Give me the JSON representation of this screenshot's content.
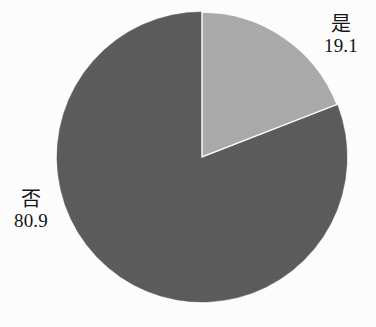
{
  "chart_data": {
    "type": "pie",
    "title": "",
    "categories": [
      "是",
      "否"
    ],
    "values": [
      19.1,
      80.9
    ],
    "labels": [
      "19.1",
      "80.9"
    ],
    "series": [
      {
        "name": "",
        "values": [
          19.1,
          80.9
        ]
      }
    ],
    "slices": [
      {
        "category": "是",
        "value": 19.1,
        "value_label": "19.1",
        "color": "#a9a9a9",
        "start_angle_deg": 0,
        "sweep_angle_deg": 68.8,
        "label_position": "outside-top-right"
      },
      {
        "category": "否",
        "value": 80.9,
        "value_label": "80.9",
        "color": "#585858",
        "start_angle_deg": 68.8,
        "sweep_angle_deg": 291.2,
        "label_position": "outside-left"
      }
    ],
    "legend": "none",
    "grid": false,
    "start_angle": "12 o'clock",
    "direction": "clockwise",
    "xlabel": "",
    "ylabel": "",
    "units": "percent",
    "background_color": "#ffffff"
  },
  "geometry": {
    "center_x": 202,
    "center_y": 157,
    "radius": 145
  },
  "labels": {
    "yes": {
      "category": "是",
      "value": "19.1"
    },
    "no": {
      "category": "否",
      "value": "80.9"
    }
  }
}
